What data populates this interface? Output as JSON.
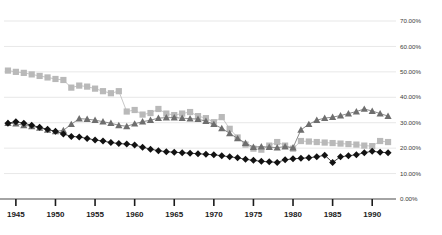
{
  "chart_data": {
    "type": "line",
    "title": "",
    "subtitle": "",
    "xlabel": "",
    "ylabel": "",
    "xlim": [
      1943.5,
      1992.5
    ],
    "ylim": [
      0,
      70
    ],
    "grid": true,
    "legend": "none",
    "y_tick_labels": [
      "0.00%",
      "10.00%",
      "20.00%",
      "30.00%",
      "40.00%",
      "50.00%",
      "60.00%",
      "70.00%"
    ],
    "y_ticks": [
      0,
      10,
      20,
      30,
      40,
      50,
      60,
      70
    ],
    "x_tick_labels": [
      "1945",
      "1950",
      "1955",
      "1960",
      "1965",
      "1970",
      "1975",
      "1980",
      "1985",
      "1990"
    ],
    "x_ticks": [
      1945,
      1950,
      1955,
      1960,
      1965,
      1970,
      1975,
      1980,
      1985,
      1990
    ],
    "x": [
      1944,
      1945,
      1946,
      1947,
      1948,
      1949,
      1950,
      1951,
      1952,
      1953,
      1954,
      1955,
      1956,
      1957,
      1958,
      1959,
      1960,
      1961,
      1962,
      1963,
      1964,
      1965,
      1966,
      1967,
      1968,
      1969,
      1970,
      1971,
      1972,
      1973,
      1974,
      1975,
      1976,
      1977,
      1978,
      1979,
      1980,
      1981,
      1982,
      1983,
      1984,
      1985,
      1986,
      1987,
      1988,
      1989,
      1990,
      1991,
      1992
    ],
    "series": [
      {
        "name": "series-squares",
        "marker": "square",
        "color": "#b9b9b9",
        "values": [
          50.5,
          50.0,
          49.6,
          49.0,
          48.4,
          47.8,
          47.2,
          46.8,
          43.8,
          44.6,
          44.2,
          43.4,
          42.4,
          41.6,
          42.4,
          34.4,
          35.0,
          33.2,
          33.8,
          35.4,
          33.6,
          33.0,
          33.6,
          34.2,
          32.6,
          31.8,
          30.2,
          32.2,
          27.6,
          24.2,
          21.4,
          19.8,
          19.4,
          21.0,
          22.4,
          21.0,
          19.8,
          22.8,
          22.6,
          22.4,
          22.2,
          22.0,
          21.8,
          21.6,
          21.4,
          21.0,
          20.8,
          22.8,
          22.4
        ]
      },
      {
        "name": "series-triangles",
        "marker": "triangle",
        "color": "#6e6e6e",
        "values": [
          29.8,
          29.6,
          29.0,
          28.6,
          28.0,
          27.2,
          26.6,
          27.0,
          29.4,
          31.6,
          31.4,
          31.0,
          30.4,
          29.8,
          29.0,
          28.6,
          29.6,
          30.4,
          31.0,
          31.8,
          32.0,
          32.0,
          31.8,
          31.6,
          31.4,
          30.6,
          29.4,
          27.8,
          25.8,
          23.8,
          22.0,
          20.4,
          20.6,
          20.4,
          20.2,
          20.6,
          20.2,
          27.2,
          29.4,
          31.0,
          31.8,
          32.2,
          32.8,
          33.6,
          34.4,
          35.4,
          34.6,
          33.6,
          32.6
        ]
      },
      {
        "name": "series-diamonds",
        "marker": "diamond",
        "color": "#121212",
        "values": [
          29.8,
          30.4,
          29.8,
          29.0,
          28.2,
          27.4,
          26.6,
          25.6,
          24.6,
          24.4,
          23.8,
          23.2,
          22.8,
          22.2,
          21.8,
          21.6,
          21.2,
          20.4,
          19.6,
          19.0,
          18.6,
          18.4,
          18.2,
          18.0,
          17.8,
          17.6,
          17.4,
          17.0,
          16.6,
          16.2,
          15.6,
          15.2,
          14.8,
          14.6,
          14.4,
          15.4,
          15.8,
          16.0,
          16.2,
          16.6,
          17.2,
          14.4,
          16.6,
          17.0,
          17.4,
          18.2,
          18.8,
          18.4,
          18.2
        ]
      }
    ]
  }
}
